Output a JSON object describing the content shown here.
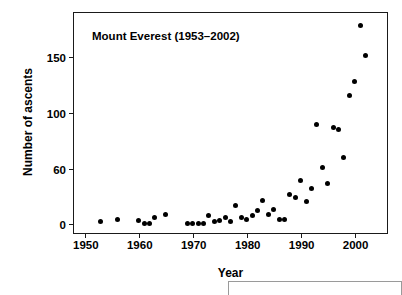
{
  "chart_data": {
    "type": "scatter",
    "title": "Mount Everest (1953–2002)",
    "xlabel": "Year",
    "ylabel": "Number of ascents",
    "xlim": [
      1948,
      2006
    ],
    "ylim": [
      -8,
      190
    ],
    "grid": false,
    "legend": null,
    "xticks": [
      1950,
      1960,
      1970,
      1980,
      1990,
      2000
    ],
    "xtick_labels": [
      "1950",
      "1960",
      "1970",
      "1980",
      "1990",
      "2000"
    ],
    "yticks": [
      0,
      60,
      100,
      150
    ],
    "ytick_labels": [
      "0",
      "60",
      "100",
      "150"
    ],
    "marker": "filled-circle",
    "marker_color": "#000000",
    "x": [
      1953,
      1956,
      1960,
      1961,
      1962,
      1963,
      1965,
      1969,
      1970,
      1971,
      1972,
      1973,
      1974,
      1975,
      1976,
      1977,
      1978,
      1979,
      1980,
      1981,
      1982,
      1983,
      1984,
      1985,
      1986,
      1987,
      1988,
      1989,
      1990,
      1991,
      1992,
      1993,
      1994,
      1995,
      1996,
      1997,
      1998,
      1999,
      2000,
      2001,
      2002
    ],
    "y": [
      2,
      4,
      3,
      1,
      1,
      6,
      9,
      1,
      1,
      1,
      1,
      8,
      2,
      3,
      6,
      2,
      17,
      6,
      4,
      8,
      12,
      21,
      9,
      13,
      4,
      4,
      27,
      24,
      39,
      20,
      32,
      90,
      51,
      37,
      87,
      85,
      60,
      116,
      128,
      179,
      152
    ],
    "point_count": 41
  },
  "figure": {
    "bottom_panel_present": true
  }
}
